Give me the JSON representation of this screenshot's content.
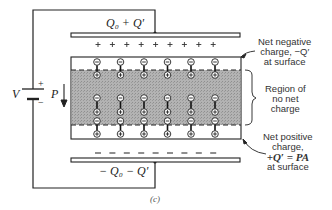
{
  "figure": {
    "caption": "(c)",
    "top_plate_label": "Q₀ + Q′",
    "bottom_plate_label": "− Q₀ − Q′",
    "battery_label": "V",
    "battery_plus": "+",
    "battery_minus": "−",
    "polarization_label": "P",
    "top_plate_sign": "+",
    "bottom_plate_sign": "−",
    "top_plate_sign_count": 9,
    "bottom_plate_sign_count": 9,
    "dipole_columns": 6,
    "dipole_rows": 3,
    "annotations": {
      "negative_surface": [
        "Net negative",
        "charge, −Q′",
        "at surface"
      ],
      "neutral_region": [
        "Region of",
        "no net",
        "charge"
      ],
      "positive_surface": [
        "Net positive",
        "charge,",
        "+Q′ = PA",
        "at surface"
      ]
    },
    "colors": {
      "line": "#222222",
      "dielectric_fill": "#a9a9a9",
      "background": "#ffffff"
    }
  }
}
